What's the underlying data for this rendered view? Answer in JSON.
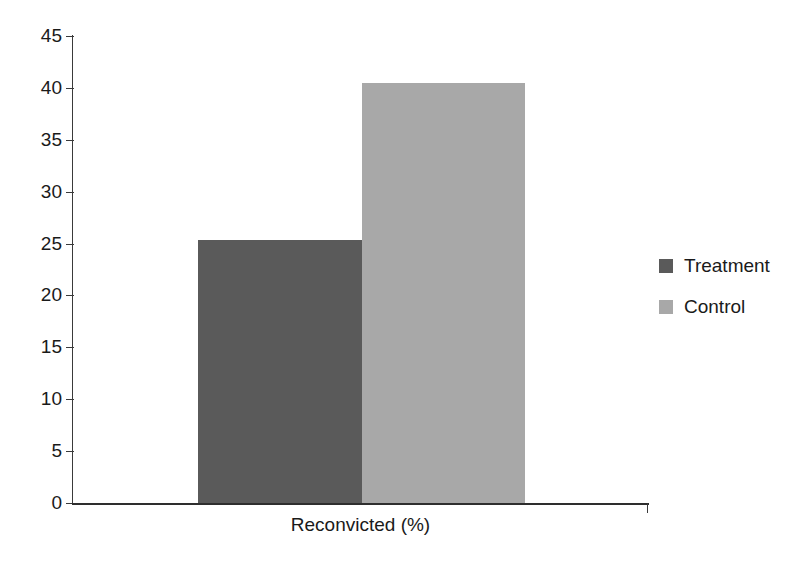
{
  "chart_data": {
    "type": "bar",
    "title": "",
    "subtitle": "",
    "xlabel": "Reconvicted (%)",
    "ylabel": "",
    "categories": [
      "Reconvicted (%)"
    ],
    "series": [
      {
        "name": "Treatment",
        "values": [
          25.3
        ],
        "color": "#5a5a5a"
      },
      {
        "name": "Control",
        "values": [
          40.5
        ],
        "color": "#a8a8a8"
      }
    ],
    "ylim": [
      0,
      45
    ],
    "yticks": [
      45,
      40,
      35,
      30,
      25,
      20,
      15,
      10,
      5,
      0
    ],
    "ytick_labels": [
      "45",
      "40",
      "35",
      "30",
      "25",
      "20",
      "15",
      "10",
      "5",
      "0"
    ],
    "xticks": [],
    "grid": false,
    "legend_position": "right",
    "legend": [
      {
        "label": "Treatment",
        "color": "#5a5a5a"
      },
      {
        "label": "Control",
        "color": "#a8a8a8"
      }
    ],
    "bars": [
      {
        "name": "Treatment",
        "value": 25.3,
        "color": "#5a5a5a"
      },
      {
        "name": "Control",
        "value": 40.5,
        "color": "#a8a8a8"
      }
    ]
  },
  "colors": {
    "background": "#ffffff",
    "axis": "#2e2e2e",
    "text": "#1a1a1a",
    "treatment": "#5a5a5a",
    "control": "#a8a8a8"
  }
}
